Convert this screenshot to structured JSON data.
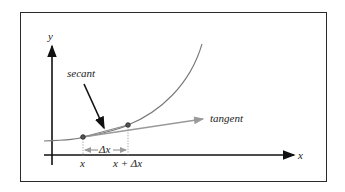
{
  "diagram": {
    "labels": {
      "y_axis": "y",
      "x_axis": "x",
      "secant": "secant",
      "tangent": "tangent",
      "point_x": "x",
      "point_x_plus_dx": "x + Δx",
      "delta_x": "Δx"
    },
    "colors": {
      "frame": "#2a2a2a",
      "axes": "#111111",
      "curve": "#7a7a7a",
      "tangent": "#9a9a9a",
      "secant_arrow": "#111111",
      "text": "#222222"
    }
  }
}
